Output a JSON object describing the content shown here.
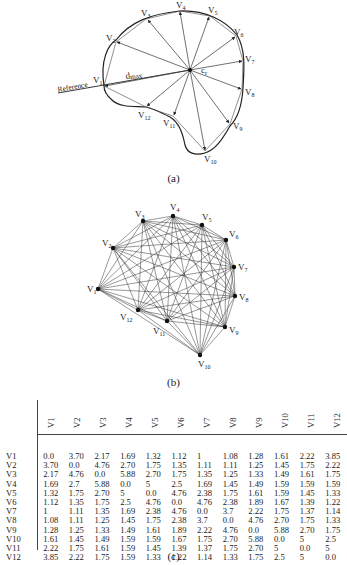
{
  "figure_a": {
    "caption": "(a)",
    "labels": {
      "reference": "Reference",
      "dmax": "d",
      "dmax_sub": "max",
      "centroid": "c",
      "centroid_sub": "r"
    },
    "vertices": [
      {
        "name": "V",
        "sub": "1"
      },
      {
        "name": "V",
        "sub": "2"
      },
      {
        "name": "V",
        "sub": "3"
      },
      {
        "name": "V",
        "sub": "4"
      },
      {
        "name": "V",
        "sub": "5"
      },
      {
        "name": "V",
        "sub": "6"
      },
      {
        "name": "V",
        "sub": "7"
      },
      {
        "name": "V",
        "sub": "8"
      },
      {
        "name": "V",
        "sub": "9"
      },
      {
        "name": "V",
        "sub": "10"
      },
      {
        "name": "V",
        "sub": "11"
      },
      {
        "name": "V",
        "sub": "12"
      }
    ]
  },
  "figure_b": {
    "caption": "(b)",
    "vertices": [
      "V1",
      "V2",
      "V3",
      "V4",
      "V5",
      "V6",
      "V7",
      "V8",
      "V9",
      "V10",
      "V11",
      "V12"
    ]
  },
  "figure_c": {
    "caption": "(c)",
    "columns": [
      "V1",
      "V2",
      "V3",
      "V4",
      "V5",
      "V6",
      "V7",
      "V8",
      "V9",
      "V10",
      "V11",
      "V12"
    ],
    "rows": [
      {
        "label": "V1",
        "values": [
          "0.0",
          "3.70",
          "2.17",
          "1.69",
          "1.32",
          "1.12",
          "1",
          "1.08",
          "1.28",
          "1.61",
          "2.22",
          "3.85"
        ]
      },
      {
        "label": "V2",
        "values": [
          "3.70",
          "0.0",
          "4.76",
          "2.70",
          "1.75",
          "1.35",
          "1.11",
          "1.11",
          "1.25",
          "1.45",
          "1.75",
          "2.22"
        ]
      },
      {
        "label": "V3",
        "values": [
          "2.17",
          "4.76",
          "0.0",
          "5.88",
          "2.70",
          "1.75",
          "1.35",
          "1.25",
          "1.33",
          "1.49",
          "1.61",
          "1.75"
        ]
      },
      {
        "label": "V4",
        "values": [
          "1.69",
          "2.7",
          "5.88",
          "0.0",
          "5",
          "2.5",
          "1.69",
          "1.45",
          "1.49",
          "1.59",
          "1.59",
          "1.59"
        ]
      },
      {
        "label": "V5",
        "values": [
          "1.32",
          "1.75",
          "2.70",
          "5",
          "0.0",
          "4.76",
          "2.38",
          "1.75",
          "1.61",
          "1.59",
          "1.45",
          "1.33"
        ]
      },
      {
        "label": "V6",
        "values": [
          "1.12",
          "1.35",
          "1.75",
          "2.5",
          "4.76",
          "0.0",
          "4.76",
          "2.38",
          "1.89",
          "1.67",
          "1.39",
          "1.22"
        ]
      },
      {
        "label": "V7",
        "values": [
          "1",
          "1.11",
          "1.35",
          "1.69",
          "2.38",
          "4.76",
          "0.0",
          "3.7",
          "2.22",
          "1.75",
          "1.37",
          "1.14"
        ]
      },
      {
        "label": "V8",
        "values": [
          "1.08",
          "1.11",
          "1.25",
          "1.45",
          "1.75",
          "2.38",
          "3.7",
          "0.0",
          "4.76",
          "2.70",
          "1.75",
          "1.33"
        ]
      },
      {
        "label": "V9",
        "values": [
          "1.28",
          "1.25",
          "1.33",
          "1.49",
          "1.61",
          "1.89",
          "2.22",
          "4.76",
          "0.0",
          "5.88",
          "2.70",
          "1.75"
        ]
      },
      {
        "label": "V10",
        "values": [
          "1.61",
          "1.45",
          "1.49",
          "1.59",
          "1.59",
          "1.67",
          "1.75",
          "2.70",
          "5.88",
          "0.0",
          "5",
          "2.5"
        ]
      },
      {
        "label": "V11",
        "values": [
          "2.22",
          "1.75",
          "1.61",
          "1.59",
          "1.45",
          "1.39",
          "1.37",
          "1.75",
          "2.70",
          "5",
          "0.0",
          "5"
        ]
      },
      {
        "label": "V12",
        "values": [
          "3.85",
          "2.22",
          "1.75",
          "1.59",
          "1.33",
          "1.22",
          "1.14",
          "1.33",
          "1.75",
          "2.5",
          "5",
          "0.0"
        ]
      }
    ]
  }
}
